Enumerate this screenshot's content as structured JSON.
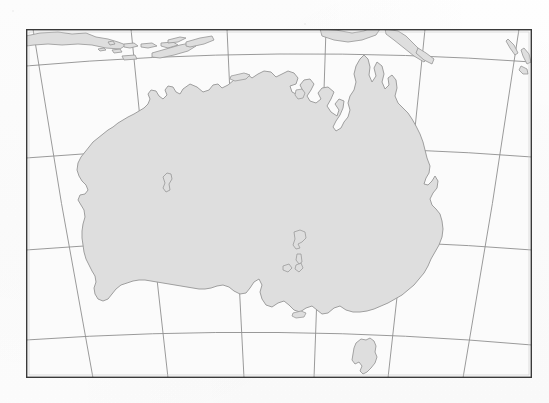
{
  "document": {
    "type": "map",
    "title": "Outline map of Australia",
    "description": "Blank photocopied outline map showing Australia with latitude and longitude graticule",
    "page_background": "#fefefe"
  },
  "map": {
    "name": "australia-outline-map",
    "projection_style": "conic",
    "frame": {
      "x": 26,
      "y": 29,
      "width": 506,
      "height": 349,
      "border_color": "#3a3a3a",
      "border_width": 1.4,
      "inner_background": "#fbfbfb"
    },
    "graticule": {
      "line_color": "#8f8f8f",
      "line_width": 0.9,
      "meridian_count": 6,
      "parallel_count": 4,
      "meridians_top_x": [
        33,
        131,
        227,
        326,
        425,
        519
      ],
      "meridians_bottom_x": [
        93,
        168,
        244,
        314,
        388,
        463
      ],
      "parallels_left_y": [
        66,
        158,
        250,
        340
      ],
      "parallels_right_y": [
        62,
        157,
        250,
        345
      ]
    },
    "land": {
      "fill_color": "#dedede",
      "stroke_color": "#9a9a9a",
      "stroke_width": 0.9
    },
    "landmasses": [
      {
        "name": "australia-mainland",
        "label": "Australia"
      },
      {
        "name": "tasmania",
        "label": "Tasmania"
      },
      {
        "name": "new-guinea",
        "label": "New Guinea"
      },
      {
        "name": "java-island",
        "label": "Java"
      },
      {
        "name": "timor-island",
        "label": "Timor"
      },
      {
        "name": "lesser-sunda-islands",
        "label": "Lesser Sunda Islands"
      },
      {
        "name": "new-zealand-fragments",
        "label": "New Zealand"
      },
      {
        "name": "kangaroo-island",
        "label": "Kangaroo Island"
      },
      {
        "name": "lake-eyre",
        "label": "Lake Eyre"
      },
      {
        "name": "groote-eylandt",
        "label": "Groote Eylandt"
      },
      {
        "name": "melville-island",
        "label": "Melville Island"
      }
    ]
  }
}
